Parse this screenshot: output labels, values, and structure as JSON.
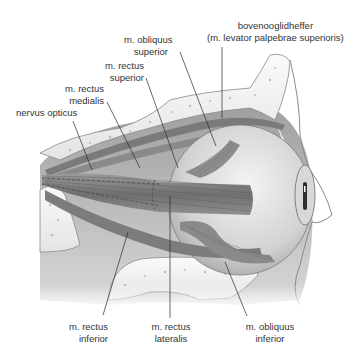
{
  "diagram": {
    "style": "grayscale anatomical illustration",
    "colors": {
      "background": "#ffffff",
      "bone": "#f2f2f2",
      "bone_outline": "#8a8a8a",
      "muscle_dark": "#5e5e5e",
      "muscle_mid": "#8c8c8c",
      "eyeball": "#dcdcdc",
      "leader_line": "#2a2a2a",
      "label_text": "#333333"
    },
    "labels": {
      "levator": {
        "line1": "bovenooglidheffer",
        "line2": "(m. levator palpebrae superioris)"
      },
      "obliquus_superior": {
        "line1": "m. obliquus",
        "line2": "superior"
      },
      "rectus_superior": {
        "line1": "m. rectus",
        "line2": "superior"
      },
      "rectus_medialis": {
        "line1": "m. rectus",
        "line2": "medialis"
      },
      "nervus_opticus": {
        "line1": "nervus opticus"
      },
      "rectus_inferior": {
        "line1": "m. rectus",
        "line2": "inferior"
      },
      "rectus_lateralis": {
        "line1": "m. rectus",
        "line2": "lateralis"
      },
      "obliquus_inferior": {
        "line1": "m. obliquus",
        "line2": "inferior"
      }
    }
  }
}
